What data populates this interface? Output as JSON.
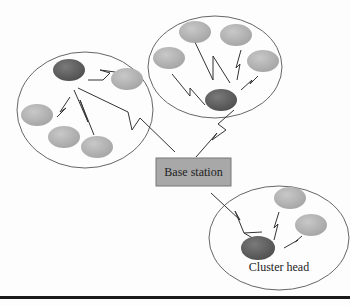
{
  "diagram": {
    "type": "wireless sensor network clustering",
    "base_station": {
      "label": "Base station",
      "fill": "#a8a8a8"
    },
    "cluster_head_label": "Cluster head",
    "colors": {
      "cluster_head": "#666666",
      "member_node": "#b8b8b8",
      "cluster_outline": "#555555",
      "links": "#333333"
    },
    "clusters": [
      {
        "name": "left-cluster",
        "members": 5,
        "has_cluster_head": true
      },
      {
        "name": "top-cluster",
        "members": 4,
        "has_cluster_head": true
      },
      {
        "name": "bottom-right-cluster",
        "members": 2,
        "has_cluster_head": true
      }
    ]
  }
}
